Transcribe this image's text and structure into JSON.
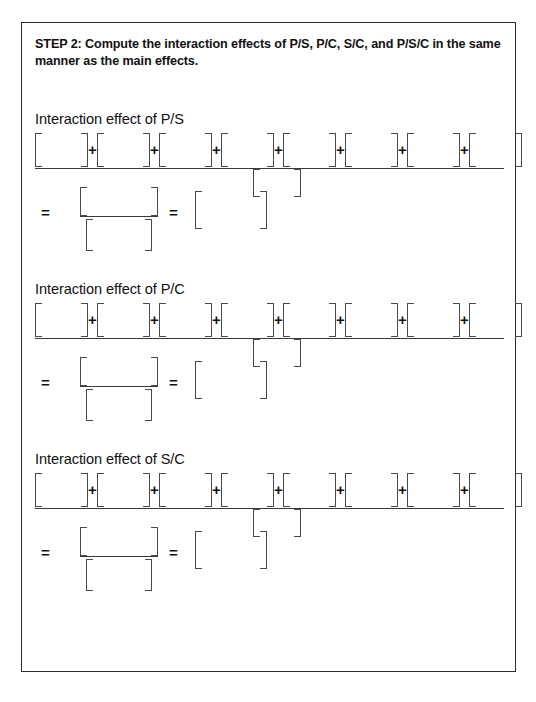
{
  "document": {
    "step_heading": "STEP 2: Compute the interaction effects of P/S, P/C, S/C, and P/S/C in the same manner as the main effects.",
    "border_color": "#2b2b2b",
    "bracket_color": "#4a4a4a",
    "rule_color": "#3a3a3a",
    "background_color": "#ffffff"
  },
  "sections": [
    {
      "title": "Interaction effect of P/S",
      "numerator_terms": 8,
      "operator": "+",
      "equals": "=",
      "blanks": {
        "numerator": [
          "",
          "",
          "",
          "",
          "",
          "",
          "",
          ""
        ],
        "denominator": "",
        "mini_numerator": "",
        "mini_denominator": "",
        "answer": ""
      }
    },
    {
      "title": "Interaction effect of P/C",
      "numerator_terms": 8,
      "operator": "+",
      "equals": "=",
      "blanks": {
        "numerator": [
          "",
          "",
          "",
          "",
          "",
          "",
          "",
          ""
        ],
        "denominator": "",
        "mini_numerator": "",
        "mini_denominator": "",
        "answer": ""
      }
    },
    {
      "title": "Interaction effect of S/C",
      "numerator_terms": 8,
      "operator": "+",
      "equals": "=",
      "blanks": {
        "numerator": [
          "",
          "",
          "",
          "",
          "",
          "",
          "",
          ""
        ],
        "denominator": "",
        "mini_numerator": "",
        "mini_denominator": "",
        "answer": ""
      }
    }
  ]
}
